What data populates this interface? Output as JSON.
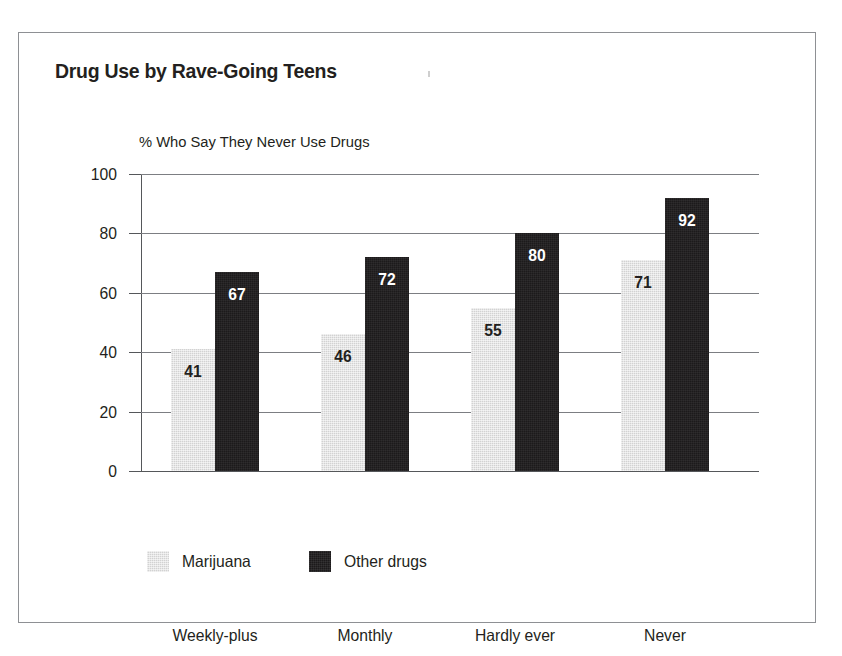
{
  "figure": {
    "title": "Drug Use by Rave-Going Teens",
    "subtitle": "% Who Say They Never Use Drugs"
  },
  "chart_data": {
    "type": "bar",
    "title": "Drug Use by Rave-Going Teens",
    "subtitle": "% Who Say They Never Use Drugs",
    "xlabel": "",
    "ylabel": "",
    "ylim": [
      0,
      100
    ],
    "yticks": [
      0,
      20,
      40,
      60,
      80,
      100
    ],
    "ytick_labels": [
      "0",
      "20",
      "40",
      "60",
      "80",
      "100"
    ],
    "grid": true,
    "legend_position": "bottom-left",
    "categories": [
      "Weekly-plus",
      "Monthly",
      "Hardly ever",
      "Never"
    ],
    "series": [
      {
        "name": "Marijuana",
        "color": "#d2d2d2",
        "values": [
          41,
          46,
          55,
          71
        ],
        "labels": [
          "41",
          "46",
          "55",
          "71"
        ]
      },
      {
        "name": "Other drugs",
        "color": "#1c1a1b",
        "values": [
          67,
          72,
          80,
          92
        ],
        "labels": [
          "67",
          "72",
          "80",
          "92"
        ]
      }
    ]
  }
}
